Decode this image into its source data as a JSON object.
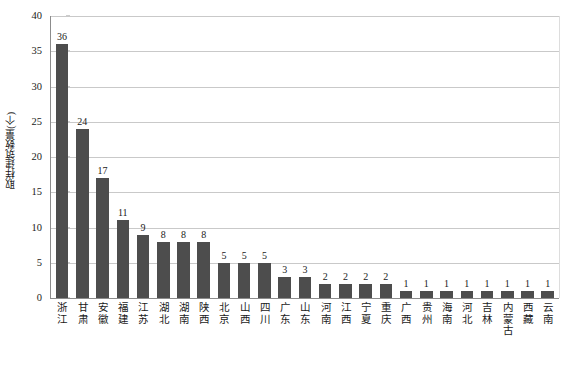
{
  "chart_data": {
    "type": "bar",
    "title": "",
    "subtitle": "",
    "xlabel": "",
    "ylabel": "取样建筑数量(个)",
    "ylim": [
      0,
      40
    ],
    "yticks": [
      0,
      5,
      10,
      15,
      20,
      25,
      30,
      35,
      40
    ],
    "grid": true,
    "legend": false,
    "bar_color": "#4d4d4d",
    "gridline_color": "#c9c9c9",
    "axis_color": "#8c8c8c",
    "text_color": "#1a1a1a",
    "categories": [
      "浙江",
      "甘肃",
      "安徽",
      "福建",
      "江苏",
      "湖北",
      "湖南",
      "陕西",
      "北京",
      "山西",
      "四川",
      "广东",
      "山东",
      "河南",
      "江西",
      "宁夏",
      "重庆",
      "广西",
      "贵州",
      "海南",
      "河北",
      "吉林",
      "内蒙古",
      "西藏",
      "云南"
    ],
    "values": [
      36,
      24,
      17,
      11,
      9,
      8,
      8,
      8,
      5,
      5,
      5,
      3,
      3,
      2,
      2,
      2,
      2,
      1,
      1,
      1,
      1,
      1,
      1,
      1,
      1
    ],
    "data_labels": [
      "36",
      "24",
      "17",
      "11",
      "9",
      "8",
      "8",
      "8",
      "5",
      "5",
      "5",
      "3",
      "3",
      "2",
      "2",
      "2",
      "2",
      "1",
      "1",
      "1",
      "1",
      "1",
      "1",
      "1",
      "1"
    ],
    "ytick_labels": [
      "0",
      "5",
      "10",
      "15",
      "20",
      "25",
      "30",
      "35",
      "40"
    ]
  }
}
